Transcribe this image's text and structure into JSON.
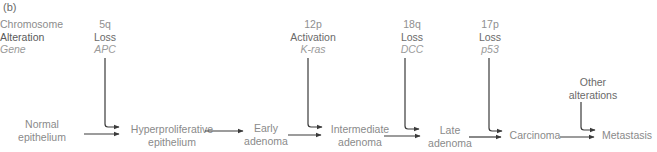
{
  "panel_label": "(b)",
  "legend": {
    "line1": "Chromosome",
    "line2": "Alteration",
    "line3": "Gene"
  },
  "mutations": [
    {
      "chromosome": "5q",
      "alteration": "Loss",
      "gene": "APC"
    },
    {
      "chromosome": "12p",
      "alteration": "Activation",
      "gene": "K-ras"
    },
    {
      "chromosome": "18q",
      "alteration": "Loss",
      "gene": "DCC"
    },
    {
      "chromosome": "17p",
      "alteration": "Loss",
      "gene": "p53"
    }
  ],
  "other_alterations": {
    "line1": "Other",
    "line2": "alterations"
  },
  "stages": [
    {
      "line1": "Normal",
      "line2": "epithelium"
    },
    {
      "line1": "Hyperproliferative",
      "line2": "epithelium"
    },
    {
      "line1": "Early",
      "line2": "adenoma"
    },
    {
      "line1": "Intermediate",
      "line2": "adenoma"
    },
    {
      "line1": "Late",
      "line2": "adenoma"
    },
    {
      "line1": "Carcinoma",
      "line2": ""
    },
    {
      "line1": "Metastasis",
      "line2": ""
    }
  ],
  "colors": {
    "arrow": "#3a3a3a",
    "text": "#8a8a8a"
  }
}
